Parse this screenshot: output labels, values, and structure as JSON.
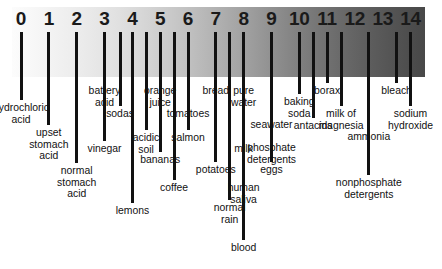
{
  "diagram": {
    "type": "ph-scale",
    "scale": {
      "min": 0,
      "max": 14,
      "ticks": [
        "0",
        "1",
        "2",
        "3",
        "4",
        "5",
        "6",
        "7",
        "8",
        "9",
        "10",
        "11",
        "12",
        "13",
        "14"
      ],
      "gradient_from": "#fcfcfc",
      "gradient_to": "#484848",
      "line_color": "#111111"
    },
    "entries": [
      {
        "label": "hydrochloric\nacid",
        "ph": 0,
        "x": 21.0,
        "line_top": 32,
        "line_bottom": 100,
        "label_y": 102
      },
      {
        "label": "upset\nstomach\nacid",
        "ph": 1,
        "x": 48.8,
        "line_top": 32,
        "line_bottom": 125,
        "label_y": 127
      },
      {
        "label": "normal\nstomach\nacid",
        "ph": 1.5,
        "x": 76.7,
        "line_top": 32,
        "line_bottom": 163,
        "label_y": 165
      },
      {
        "label": "battery\nacid",
        "ph": 2,
        "x": 104.5,
        "line_top": 32,
        "line_bottom": 83,
        "label_y": 85
      },
      {
        "label": "sodas",
        "ph": 2.7,
        "x": 120.0,
        "line_top": 32,
        "line_bottom": 106,
        "label_y": 108
      },
      {
        "label": "vinegar",
        "ph": 3,
        "x": 104.5,
        "line_top": 32,
        "line_bottom": 141,
        "label_y": 143
      },
      {
        "label": "lemons",
        "ph": 3.2,
        "x": 132.4,
        "line_top": 32,
        "line_bottom": 203,
        "label_y": 205
      },
      {
        "label": "orange\njuice",
        "ph": 3.8,
        "x": 160.2,
        "line_top": 32,
        "line_bottom": 83,
        "label_y": 85
      },
      {
        "label": "acidic\nsoil",
        "ph": 4.2,
        "x": 146.0,
        "line_top": 32,
        "line_bottom": 130,
        "label_y": 132
      },
      {
        "label": "bananas",
        "ph": 4.6,
        "x": 160.2,
        "line_top": 32,
        "line_bottom": 152,
        "label_y": 154
      },
      {
        "label": "tomatoes",
        "ph": 4.5,
        "x": 188.0,
        "line_top": 32,
        "line_bottom": 106,
        "label_y": 108
      },
      {
        "label": "salmon",
        "ph": 5.2,
        "x": 188.0,
        "line_top": 32,
        "line_bottom": 130,
        "label_y": 132
      },
      {
        "label": "coffee",
        "ph": 5.3,
        "x": 174.1,
        "line_top": 32,
        "line_bottom": 180,
        "label_y": 182
      },
      {
        "label": "bread",
        "ph": 5.6,
        "x": 215.8,
        "line_top": 32,
        "line_bottom": 83,
        "label_y": 85
      },
      {
        "label": "potatoes",
        "ph": 5.9,
        "x": 215.8,
        "line_top": 32,
        "line_bottom": 162,
        "label_y": 164
      },
      {
        "label": "milk",
        "ph": 6.5,
        "x": 243.6,
        "line_top": 32,
        "line_bottom": 141,
        "label_y": 143
      },
      {
        "label": "normal\nrain",
        "ph": 6.0,
        "x": 229.7,
        "line_top": 32,
        "line_bottom": 200,
        "label_y": 202
      },
      {
        "label": "pure\nwater",
        "ph": 7,
        "x": 243.6,
        "line_top": 32,
        "line_bottom": 83,
        "label_y": 85
      },
      {
        "label": "human\nsaliva",
        "ph": 7.0,
        "x": 243.6,
        "line_top": 32,
        "line_bottom": 180,
        "label_y": 182
      },
      {
        "label": "blood",
        "ph": 7.4,
        "x": 243.6,
        "line_top": 32,
        "line_bottom": 240,
        "label_y": 242
      },
      {
        "label": "eggs",
        "ph": 7.8,
        "x": 271.5,
        "line_top": 32,
        "line_bottom": 162,
        "label_y": 164
      },
      {
        "label": "seawater",
        "ph": 8.1,
        "x": 271.5,
        "line_top": 32,
        "line_bottom": 117,
        "label_y": 119
      },
      {
        "label": "phosphate\ndetergents",
        "ph": 8.5,
        "x": 271.5,
        "line_top": 32,
        "line_bottom": 140,
        "label_y": 142
      },
      {
        "label": "baking\nsoda",
        "ph": 9,
        "x": 299.3,
        "line_top": 32,
        "line_bottom": 94,
        "label_y": 96
      },
      {
        "label": "borax",
        "ph": 9.4,
        "x": 327.1,
        "line_top": 32,
        "line_bottom": 83,
        "label_y": 85
      },
      {
        "label": "antacids",
        "ph": 9.8,
        "x": 313.2,
        "line_top": 32,
        "line_bottom": 118,
        "label_y": 120
      },
      {
        "label": "milk of\nmagnesia",
        "ph": 10.5,
        "x": 341.0,
        "line_top": 32,
        "line_bottom": 106,
        "label_y": 108
      },
      {
        "label": "ammonia",
        "ph": 11.3,
        "x": 368.8,
        "line_top": 32,
        "line_bottom": 129,
        "label_y": 131
      },
      {
        "label": "nonphosphate\ndetergents",
        "ph": 10.7,
        "x": 368.8,
        "line_top": 32,
        "line_bottom": 175,
        "label_y": 177
      },
      {
        "label": "bleach",
        "ph": 12.6,
        "x": 396.6,
        "line_top": 32,
        "line_bottom": 83,
        "label_y": 85
      },
      {
        "label": "sodium\nhydroxide",
        "ph": 14,
        "x": 410.5,
        "line_top": 32,
        "line_bottom": 106,
        "label_y": 108
      }
    ]
  }
}
